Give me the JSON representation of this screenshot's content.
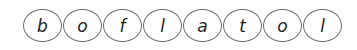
{
  "letters": [
    {
      "char": "b"
    },
    {
      "char": "o"
    },
    {
      "char": "f"
    },
    {
      "char": "l"
    },
    {
      "char": "a"
    },
    {
      "char": "t"
    },
    {
      "char": "o"
    },
    {
      "char": "l"
    }
  ]
}
